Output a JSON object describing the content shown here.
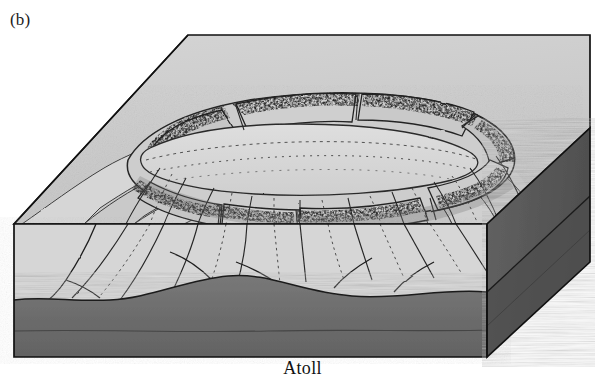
{
  "figure": {
    "panel_label": "(b)",
    "caption": "Atoll",
    "type": "3d-block-diagram",
    "style": "grayscale line drawing with stippled shading"
  },
  "palette": {
    "background": "#ffffff",
    "ink": "#1a1a1a",
    "water_surface_plane": "#cfcfcf",
    "upper_block_face": "#c8c8c8",
    "flank_light": "#d2d2d2",
    "flank_mid": "#bdbdbd",
    "flank_shadow": "#a6a6a6",
    "lagoon_floor": "#d8d8d8",
    "reef_flat": "#c4c4c4",
    "reef_dark_stipple": "#2b2b2b",
    "basement_dark": "#6e6e6e",
    "basement_darker": "#5e5e5e",
    "side_face_dark": "#5a5a5a"
  },
  "block": {
    "label": "block-outline",
    "vertices": {
      "back_left": [
        188,
        35
      ],
      "back_right": [
        590,
        35
      ],
      "right_corner": [
        590,
        128
      ],
      "front_right_top": [
        487,
        224
      ],
      "front_left_top": [
        14,
        224
      ],
      "left_corner": [
        14,
        224
      ],
      "front_left_bottom": [
        14,
        357
      ],
      "front_right_bottom": [
        487,
        357
      ],
      "right_bottom": [
        590,
        262
      ]
    }
  },
  "features": [
    {
      "name": "water-surface-plane",
      "desc": "flat sea-level plane forming top of the block"
    },
    {
      "name": "atoll-rim-reef",
      "desc": "ring of reef flats and low islands encircling the lagoon"
    },
    {
      "name": "central-lagoon",
      "desc": "shallow enclosed lagoon inside the reef ring"
    },
    {
      "name": "reef-passes",
      "desc": "gaps cutting through the rim connecting lagoon to open ocean"
    },
    {
      "name": "volcanic-flanks",
      "desc": "steep submerged slopes of the drowned volcano"
    },
    {
      "name": "erosion-gullies",
      "desc": "radial ravines and canyons incising the flanks"
    },
    {
      "name": "basement-layer",
      "desc": "dark stratified rock unit at the base of the block"
    }
  ],
  "layers": [
    {
      "name": "sea-surface",
      "tone": "#cfcfcf"
    },
    {
      "name": "reef-and-lagoon",
      "tone": "#d8d8d8"
    },
    {
      "name": "volcanic-edifice",
      "tone": "#c2c2c2"
    },
    {
      "name": "basement",
      "tone": "#6e6e6e"
    }
  ]
}
